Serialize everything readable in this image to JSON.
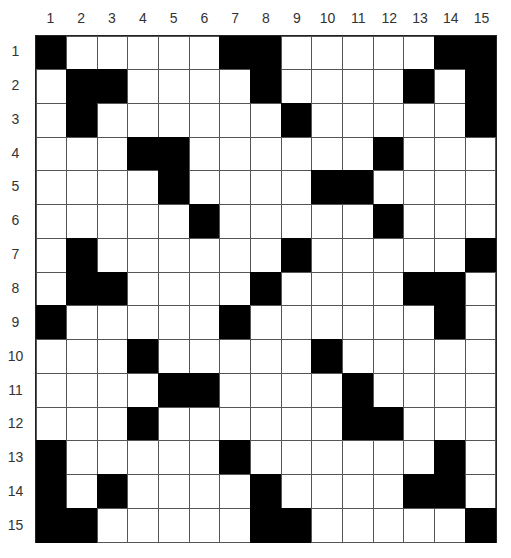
{
  "puzzle": {
    "rows": 15,
    "cols": 15,
    "column_labels": [
      "1",
      "2",
      "3",
      "4",
      "5",
      "6",
      "7",
      "8",
      "9",
      "10",
      "11",
      "12",
      "13",
      "14",
      "15"
    ],
    "row_labels": [
      "1",
      "2",
      "3",
      "4",
      "5",
      "6",
      "7",
      "8",
      "9",
      "10",
      "11",
      "12",
      "13",
      "14",
      "15"
    ],
    "black_cells": [
      [
        1,
        7,
        8,
        14,
        15
      ],
      [
        2,
        3,
        8,
        13,
        15
      ],
      [
        2,
        9,
        15
      ],
      [
        4,
        5,
        12
      ],
      [
        5,
        10,
        11
      ],
      [
        6,
        12
      ],
      [
        2,
        9,
        15
      ],
      [
        2,
        3,
        8,
        13,
        14
      ],
      [
        1,
        7,
        14
      ],
      [
        4,
        10
      ],
      [
        5,
        6,
        11
      ],
      [
        4,
        11,
        12
      ],
      [
        1,
        7,
        14
      ],
      [
        1,
        3,
        8,
        13,
        14
      ],
      [
        1,
        2,
        8,
        9,
        15
      ]
    ],
    "colors": {
      "black": "#000000",
      "white": "#ffffff",
      "line": "#555555"
    }
  }
}
